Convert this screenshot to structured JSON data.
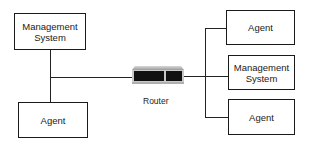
{
  "diagram": {
    "left": {
      "top_box": {
        "line1": "Management",
        "line2": "System"
      },
      "bottom_box": {
        "label": "Agent"
      }
    },
    "router": {
      "label": "Router",
      "icon": "router-icon"
    },
    "right": {
      "boxes": [
        {
          "line1": "Agent",
          "line2": ""
        },
        {
          "line1": "Management",
          "line2": "System"
        },
        {
          "line1": "Agent",
          "line2": ""
        }
      ]
    }
  }
}
